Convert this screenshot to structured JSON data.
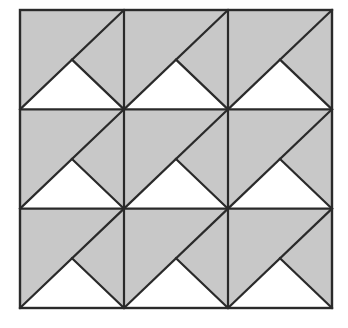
{
  "figure": {
    "title": "Tiled square pattern of shaded and unshaded triangles",
    "canvas_width": 348,
    "canvas_height": 328,
    "background_color": "#ffffff"
  },
  "style": {
    "shaded_fill": "#c8c8c8",
    "unshaded_fill": "#ffffff",
    "stroke_color": "#2a2a2a",
    "outer_border_width": 2.4,
    "grid_line_width": 2.2,
    "diagonal_line_width": 2.2
  },
  "geometry": {
    "outer_square": {
      "x": 20,
      "y": 10,
      "width": 312,
      "height": 298
    },
    "grid": {
      "rows": 3,
      "columns": 3,
      "cell_width": 104,
      "cell_height": 99.3333,
      "vertical_grid_lines_x": [
        124,
        228
      ],
      "horizontal_grid_lines_y": [
        109.3333,
        208.6667
      ]
    },
    "cell_motif": {
      "name": "shaded-cell-with-white-triangle",
      "base_fill": "#c8c8c8",
      "main_diagonal": {
        "from": "bottom-left",
        "to": "top-right"
      },
      "white_triangle": {
        "apex": "cell-center",
        "base_left": "bottom-left-corner",
        "base_right": "bottom-right-corner",
        "fill": "#ffffff"
      }
    }
  },
  "chart_data": {
    "type": "diagram",
    "title": "Tiled square pattern of shaded and unshaded triangles",
    "grid_rows": 3,
    "grid_columns": 3,
    "total_cells": 9,
    "cells": [
      {
        "row": 1,
        "column": 1,
        "id": "cell-r1c1",
        "motif": "shaded-cell-with-white-triangle",
        "shaded_fraction": 0.5,
        "unshaded_fraction": 0.5
      },
      {
        "row": 1,
        "column": 2,
        "id": "cell-r1c2",
        "motif": "shaded-cell-with-white-triangle",
        "shaded_fraction": 0.5,
        "unshaded_fraction": 0.5
      },
      {
        "row": 1,
        "column": 3,
        "id": "cell-r1c3",
        "motif": "shaded-cell-with-white-triangle",
        "shaded_fraction": 0.5,
        "unshaded_fraction": 0.5
      },
      {
        "row": 2,
        "column": 1,
        "id": "cell-r2c1",
        "motif": "shaded-cell-with-white-triangle",
        "shaded_fraction": 0.5,
        "unshaded_fraction": 0.5
      },
      {
        "row": 2,
        "column": 2,
        "id": "cell-r2c2",
        "motif": "shaded-cell-with-white-triangle",
        "shaded_fraction": 0.5,
        "unshaded_fraction": 0.5
      },
      {
        "row": 2,
        "column": 3,
        "id": "cell-r2c3",
        "motif": "shaded-cell-with-white-triangle",
        "shaded_fraction": 0.5,
        "unshaded_fraction": 0.5
      },
      {
        "row": 3,
        "column": 1,
        "id": "cell-r3c1",
        "motif": "shaded-cell-with-white-triangle",
        "shaded_fraction": 0.5,
        "unshaded_fraction": 0.5
      },
      {
        "row": 3,
        "column": 2,
        "id": "cell-r3c2",
        "motif": "shaded-cell-with-white-triangle",
        "shaded_fraction": 0.5,
        "unshaded_fraction": 0.5
      },
      {
        "row": 3,
        "column": 3,
        "id": "cell-r3c3",
        "motif": "shaded-cell-with-white-triangle",
        "shaded_fraction": 0.5,
        "unshaded_fraction": 0.5
      }
    ],
    "legend": [],
    "annotations": [],
    "labels": []
  }
}
